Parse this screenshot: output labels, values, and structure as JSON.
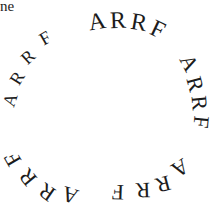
{
  "fragment_text": "ne",
  "word": "ARRF",
  "groups": [
    {
      "name": "top",
      "letters": [
        {
          "ch": "A",
          "x": 97,
          "y": 21,
          "rot": -10,
          "size": 24
        },
        {
          "ch": "R",
          "x": 118,
          "y": 20,
          "rot": -2,
          "size": 24
        },
        {
          "ch": "R",
          "x": 139,
          "y": 22,
          "rot": 10,
          "size": 24
        },
        {
          "ch": "F",
          "x": 158,
          "y": 29,
          "rot": 25,
          "size": 24
        }
      ]
    },
    {
      "name": "right",
      "letters": [
        {
          "ch": "A",
          "x": 189,
          "y": 63,
          "rot": 62,
          "size": 22
        },
        {
          "ch": "R",
          "x": 195,
          "y": 84,
          "rot": 75,
          "size": 22
        },
        {
          "ch": "R",
          "x": 199,
          "y": 103,
          "rot": 85,
          "size": 22
        },
        {
          "ch": "F",
          "x": 201,
          "y": 122,
          "rot": 95,
          "size": 22
        }
      ]
    },
    {
      "name": "bottom-right",
      "letters": [
        {
          "ch": "A",
          "x": 180,
          "y": 168,
          "rot": 148,
          "size": 22
        },
        {
          "ch": "R",
          "x": 163,
          "y": 184,
          "rot": 165,
          "size": 22
        },
        {
          "ch": "R",
          "x": 143,
          "y": 190,
          "rot": 178,
          "size": 22
        },
        {
          "ch": "F",
          "x": 118,
          "y": 192,
          "rot": 182,
          "size": 22
        }
      ]
    },
    {
      "name": "bottom-left",
      "letters": [
        {
          "ch": "A",
          "x": 70,
          "y": 195,
          "rot": 198,
          "size": 22
        },
        {
          "ch": "R",
          "x": 47,
          "y": 192,
          "rot": 215,
          "size": 22
        },
        {
          "ch": "R",
          "x": 28,
          "y": 177,
          "rot": 230,
          "size": 22
        },
        {
          "ch": "F",
          "x": 13,
          "y": 159,
          "rot": 240,
          "size": 22
        }
      ]
    },
    {
      "name": "left",
      "letters": [
        {
          "ch": "A",
          "x": 10,
          "y": 100,
          "rot": -72,
          "size": 18
        },
        {
          "ch": "R",
          "x": 17,
          "y": 78,
          "rot": -58,
          "size": 18
        },
        {
          "ch": "R",
          "x": 28,
          "y": 57,
          "rot": -42,
          "size": 18
        },
        {
          "ch": "F",
          "x": 45,
          "y": 38,
          "rot": -30,
          "size": 18
        }
      ]
    }
  ]
}
